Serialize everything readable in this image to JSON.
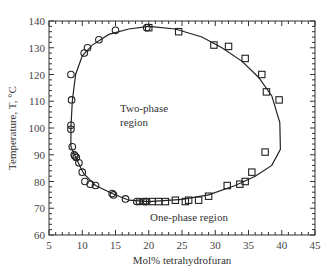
{
  "chart_data": {
    "type": "scatter",
    "title": "",
    "xlabel": "Mol% tetrahydrofuran",
    "ylabel": "Temperature, T, °C",
    "xlim": [
      5,
      45
    ],
    "ylim": [
      60,
      140
    ],
    "xticks": [
      5,
      10,
      15,
      20,
      25,
      30,
      35,
      40,
      45
    ],
    "yticks": [
      60,
      70,
      80,
      90,
      100,
      110,
      120,
      130,
      140
    ],
    "annotations": [
      "Two-phase region",
      "One-phase region"
    ],
    "series": [
      {
        "name": "circles",
        "marker": "circle",
        "x": [
          8.3,
          8.3,
          8.4,
          8.3,
          8.5,
          8.8,
          8.9,
          9.1,
          9.5,
          10.0,
          10.4,
          11.2,
          12.0,
          14.5,
          14.7,
          16.5,
          18.2,
          18.6,
          19.2,
          19.5,
          19.7,
          10.3,
          10.8,
          12.5,
          15.0,
          19.7
        ],
        "y": [
          101,
          99.5,
          110.5,
          120,
          93,
          90,
          89.5,
          89,
          87,
          83.5,
          80,
          79,
          78.5,
          75.5,
          75,
          73.5,
          72.5,
          72.5,
          72.5,
          72.5,
          72.5,
          128,
          130,
          133,
          136.5,
          137.5
        ]
      },
      {
        "name": "squares",
        "marker": "square",
        "x": [
          20.5,
          21.5,
          22.5,
          24,
          26,
          29,
          29.8,
          32,
          34.5,
          37,
          37.7,
          39.6,
          37.5,
          35.5,
          34.5,
          33.7,
          31.8,
          27.5,
          25.5,
          20,
          24.5
        ],
        "y": [
          72.5,
          72.5,
          72.5,
          73,
          73,
          74.5,
          131,
          130.5,
          126,
          120,
          113.5,
          110.5,
          91,
          83.5,
          80,
          79,
          78.5,
          73,
          72.5,
          137.5,
          136
        ]
      }
    ]
  },
  "labels": {
    "two_phase": [
      "Two-phase",
      "region"
    ],
    "one_phase": "One-phase region",
    "xlabel": "Mol% tetrahydrofuran",
    "ylabel": "Temperature, T, °C"
  }
}
